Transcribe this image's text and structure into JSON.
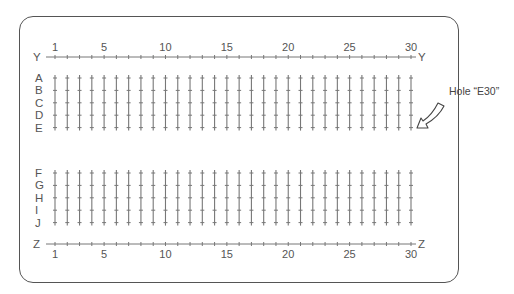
{
  "board": {
    "columns": 30,
    "column_tick_labels": [
      "1",
      "5",
      "10",
      "15",
      "20",
      "25",
      "30"
    ],
    "column_tick_values": [
      1,
      5,
      10,
      15,
      20,
      25,
      30
    ],
    "top_rail_label": "Y",
    "bottom_rail_label": "Z",
    "upper_rows": [
      "A",
      "B",
      "C",
      "D",
      "E"
    ],
    "lower_rows": [
      "F",
      "G",
      "H",
      "I",
      "J"
    ]
  },
  "callout": {
    "label": "Hole “E30”",
    "target_row": "E",
    "target_column": 30
  },
  "colors": {
    "line": "#777777",
    "border": "#555555",
    "text": "#555555"
  }
}
